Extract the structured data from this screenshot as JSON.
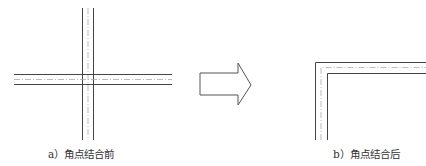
{
  "diagram": {
    "left": {
      "caption": "a）角点结合前"
    },
    "arrow": {
      "icon": "right-arrow-icon"
    },
    "right": {
      "caption": "b）角点结合后"
    },
    "colors": {
      "solid_line": "#444444",
      "center_line": "#aaaaaa",
      "arrow_stroke": "#555555"
    }
  }
}
